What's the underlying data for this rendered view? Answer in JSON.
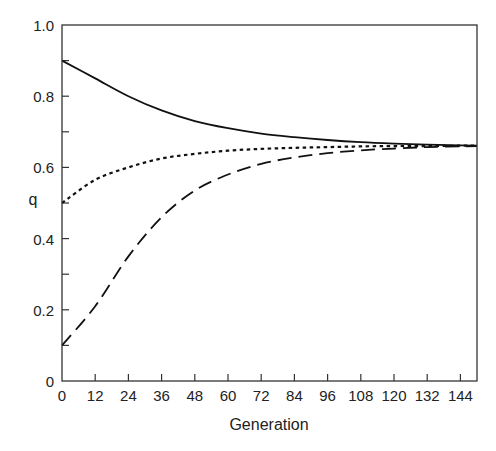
{
  "chart_data": {
    "type": "line",
    "title": "",
    "xlabel": "Generation",
    "ylabel": "q",
    "xlim": [
      0,
      150
    ],
    "ylim": [
      0,
      1.0
    ],
    "grid": false,
    "legend": null,
    "x_ticks": [
      "0",
      "12",
      "24",
      "36",
      "48",
      "60",
      "72",
      "84",
      "96",
      "108",
      "120",
      "132",
      "144"
    ],
    "y_ticks": [
      "0",
      "0.2",
      "0.4",
      "0.6",
      "0.8",
      "1.0"
    ],
    "y_minor_ticks": [
      0.1,
      0.3,
      0.5,
      0.7,
      0.9
    ],
    "x": [
      0,
      12,
      24,
      36,
      48,
      60,
      72,
      84,
      96,
      108,
      120,
      132,
      144,
      150
    ],
    "series": [
      {
        "name": "q0 = 0.9",
        "style": "solid",
        "values": [
          0.9,
          0.85,
          0.8,
          0.76,
          0.73,
          0.71,
          0.695,
          0.685,
          0.677,
          0.671,
          0.667,
          0.664,
          0.662,
          0.661
        ]
      },
      {
        "name": "q0 = 0.5",
        "style": "dotted",
        "values": [
          0.5,
          0.565,
          0.6,
          0.625,
          0.638,
          0.647,
          0.652,
          0.655,
          0.657,
          0.659,
          0.66,
          0.66,
          0.661,
          0.661
        ]
      },
      {
        "name": "q0 = 0.1",
        "style": "dashed",
        "values": [
          0.1,
          0.21,
          0.35,
          0.46,
          0.535,
          0.58,
          0.61,
          0.628,
          0.64,
          0.648,
          0.653,
          0.657,
          0.659,
          0.66
        ]
      }
    ],
    "annotations": []
  },
  "labels": {
    "xlabel": "Generation",
    "ylabel": "q"
  }
}
